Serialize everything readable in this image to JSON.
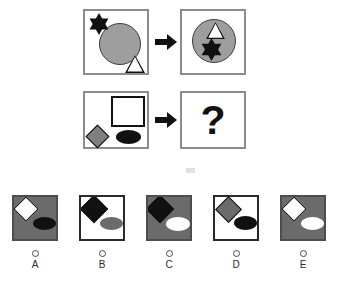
{
  "puzzle": {
    "type": "visual-analogy-matrix",
    "question_mark": "?",
    "arrow_icon": "right-arrow-icon",
    "rows": [
      {
        "row_label": "row-1",
        "source_panel": {
          "name": "panel-row1-source",
          "background": "#ffffff",
          "shapes": [
            {
              "shape": "star",
              "points": 6,
              "fill": "#111111",
              "position": "top-left"
            },
            {
              "shape": "circle",
              "fill": "#9e9e9e",
              "stroke": "#3d3d3d",
              "position": "center",
              "size": "large"
            },
            {
              "shape": "triangle",
              "fill": "#ffffff",
              "stroke": "#111111",
              "position": "bottom-right",
              "size": "small"
            }
          ]
        },
        "result_panel": {
          "name": "panel-row1-result",
          "background": "#ffffff",
          "shapes": [
            {
              "shape": "circle",
              "fill": "#9e9e9e",
              "stroke": "#3d3d3d",
              "position": "center",
              "size": "large"
            },
            {
              "shape": "triangle",
              "fill": "#ffffff",
              "stroke": "#111111",
              "position": "inside-circle-top",
              "size": "small"
            },
            {
              "shape": "star",
              "points": 6,
              "fill": "#111111",
              "position": "inside-circle-bottom"
            }
          ]
        }
      },
      {
        "row_label": "row-2",
        "source_panel": {
          "name": "panel-row2-source",
          "background": "#ffffff",
          "shapes": [
            {
              "shape": "square",
              "fill": "#ffffff",
              "stroke": "#111111",
              "position": "top-right",
              "size": "large"
            },
            {
              "shape": "diamond",
              "fill": "#7f7f7f",
              "stroke": "#111111",
              "position": "bottom-left"
            },
            {
              "shape": "ellipse",
              "fill": "#111111",
              "position": "bottom-right"
            }
          ]
        },
        "result_panel": {
          "name": "panel-row2-result",
          "background": "#ffffff",
          "content": "?"
        }
      }
    ]
  },
  "options": [
    {
      "id": "A",
      "letter": "A",
      "background": "#6b6b6b",
      "border": "#4d4d4d",
      "diamond": {
        "fill": "#ffffff",
        "stroke": "#111111",
        "position": "top-left"
      },
      "ellipse": {
        "fill": "#111111",
        "position": "bottom-right"
      },
      "selected": false
    },
    {
      "id": "B",
      "letter": "B",
      "background": "#ffffff",
      "border": "#2b2b2b",
      "diamond": {
        "fill": "#111111",
        "stroke": "#111111",
        "position": "top-left"
      },
      "ellipse": {
        "fill": "#6b6b6b",
        "position": "bottom-right"
      },
      "selected": false
    },
    {
      "id": "C",
      "letter": "C",
      "background": "#6b6b6b",
      "border": "#4d4d4d",
      "diamond": {
        "fill": "#111111",
        "stroke": "#111111",
        "position": "top-left"
      },
      "ellipse": {
        "fill": "#ffffff",
        "position": "bottom-right"
      },
      "selected": false
    },
    {
      "id": "D",
      "letter": "D",
      "background": "#ffffff",
      "border": "#2b2b2b",
      "diamond": {
        "fill": "#6b6b6b",
        "stroke": "#111111",
        "position": "top-left"
      },
      "ellipse": {
        "fill": "#111111",
        "position": "bottom-right"
      },
      "selected": false
    },
    {
      "id": "E",
      "letter": "E",
      "background": "#6b6b6b",
      "border": "#4d4d4d",
      "diamond": {
        "fill": "#ffffff",
        "stroke": "#111111",
        "position": "top-left"
      },
      "ellipse": {
        "fill": "#ffffff",
        "position": "bottom-right"
      },
      "selected": false
    }
  ],
  "colors": {
    "page_background": "#ffffff",
    "gray_fill": "#9e9e9e",
    "dark_gray": "#6b6b6b",
    "black": "#111111",
    "white": "#ffffff",
    "panel_border": "#8c8c8c"
  }
}
